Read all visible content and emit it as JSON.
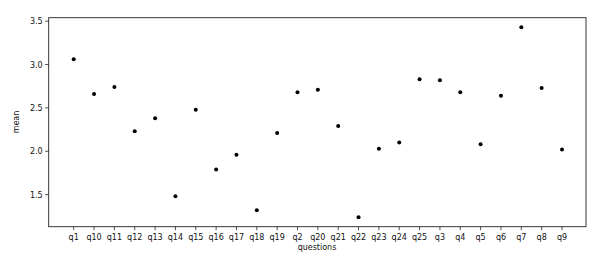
{
  "chart_data": {
    "type": "scatter",
    "title": "",
    "xlabel": "questions",
    "ylabel": "mean",
    "categories": [
      "q1",
      "q10",
      "q11",
      "q12",
      "q13",
      "q14",
      "q15",
      "q16",
      "q17",
      "q18",
      "q19",
      "q2",
      "q20",
      "q21",
      "q22",
      "q23",
      "q24",
      "q25",
      "q3",
      "q4",
      "q5",
      "q6",
      "q7",
      "q8",
      "q9"
    ],
    "values": [
      3.06,
      2.66,
      2.74,
      2.23,
      2.38,
      1.48,
      2.48,
      1.79,
      1.96,
      1.32,
      2.21,
      2.68,
      2.71,
      2.29,
      1.24,
      2.03,
      2.1,
      2.83,
      2.82,
      2.68,
      2.08,
      2.64,
      3.43,
      2.73,
      2.02
    ],
    "yticks": [
      1.5,
      2.0,
      2.5,
      3.0,
      3.5
    ],
    "ytick_labels": [
      "1.5",
      "2.0",
      "2.5",
      "3.0",
      "3.5"
    ],
    "ylim": [
      1.13,
      3.54
    ],
    "grid": false,
    "legend": null,
    "marker_color": "#000000"
  }
}
